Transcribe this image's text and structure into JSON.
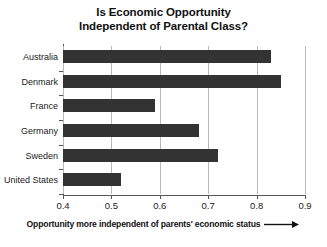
{
  "chart_data": {
    "type": "bar",
    "orientation": "horizontal",
    "title": "Is Economic Opportunity Independent of Parental Class?",
    "title_lines": [
      "Is Economic Opportunity",
      "Independent of Parental Class?"
    ],
    "categories": [
      "Australia",
      "Denmark",
      "France",
      "Germany",
      "Sweden",
      "United States"
    ],
    "values": [
      0.83,
      0.85,
      0.59,
      0.68,
      0.72,
      0.52
    ],
    "xlabel": "Opportunity more independent of parents' economic status",
    "ylabel": "",
    "xlim": [
      0.4,
      0.9
    ],
    "xticks": [
      0.4,
      0.5,
      0.6,
      0.7,
      0.8,
      0.9
    ],
    "xtick_labels": [
      "0.4",
      "0.5",
      "0.6",
      "0.7",
      "0.8",
      "0.9"
    ],
    "grid": true,
    "grid_axis": "x",
    "legend": false,
    "bar_color": "#333333",
    "grid_color": "#b9b9b9",
    "axis_color": "#555555",
    "background": "#ffffff"
  },
  "caption": {
    "text": "Opportunity more independent of parents' economic status",
    "arrow_icon": "arrow-right-icon"
  }
}
